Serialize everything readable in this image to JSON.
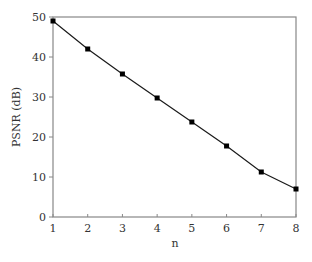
{
  "chart_data": {
    "type": "line",
    "title": "",
    "xlabel": "n",
    "ylabel": "PSNR (dB)",
    "x": [
      1,
      2,
      3,
      4,
      5,
      6,
      7,
      8
    ],
    "series": [
      {
        "name": "PSNR",
        "values": [
          49.0,
          42.0,
          35.75,
          29.75,
          23.75,
          17.75,
          11.25,
          7.0
        ],
        "color": "#000000",
        "marker": "square"
      }
    ],
    "xlim": [
      1,
      8
    ],
    "ylim": [
      0,
      50
    ],
    "xticks": [
      1,
      2,
      3,
      4,
      5,
      6,
      7,
      8
    ],
    "yticks": [
      0,
      10,
      20,
      30,
      40,
      50
    ],
    "grid": false,
    "legend": null
  },
  "style": {
    "axis_color": "#888888",
    "line_color": "#1a1a1a",
    "marker_color": "#000000",
    "text_color": "#333333"
  }
}
